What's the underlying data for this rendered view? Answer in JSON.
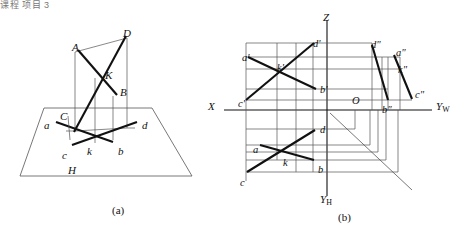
{
  "page": {
    "corner_text": "课程 项目 3",
    "background": "#ffffff",
    "ink": "#111111",
    "thin_line": "#555555"
  },
  "figures": [
    {
      "id": "pictorial",
      "caption": "(a)",
      "plane_label": "H",
      "labels": [
        {
          "text": "A",
          "x": 72,
          "y": 42
        },
        {
          "text": "D",
          "x": 123,
          "y": 28
        },
        {
          "text": "K",
          "x": 105,
          "y": 70
        },
        {
          "text": "B",
          "x": 120,
          "y": 87
        },
        {
          "text": "C",
          "x": 60,
          "y": 111
        },
        {
          "text": "a",
          "x": 44,
          "y": 120
        },
        {
          "text": "d",
          "x": 142,
          "y": 120
        },
        {
          "text": "c",
          "x": 62,
          "y": 150
        },
        {
          "text": "k",
          "x": 87,
          "y": 146
        },
        {
          "text": "b",
          "x": 118,
          "y": 146
        },
        {
          "text": "H",
          "x": 68,
          "y": 165
        }
      ]
    },
    {
      "id": "projection",
      "caption": "(b)",
      "axes": [
        {
          "name": "Z",
          "label": "Z"
        },
        {
          "name": "X",
          "label": "X"
        },
        {
          "name": "YW",
          "label": "Y",
          "sub": "W"
        },
        {
          "name": "YH",
          "label": "Y",
          "sub": "H"
        },
        {
          "name": "O",
          "label": "O"
        }
      ],
      "views": {
        "front": [
          "a'",
          "k'",
          "d'",
          "b'",
          "c'"
        ],
        "top": [
          "a",
          "k",
          "d",
          "b",
          "c"
        ],
        "side": [
          "d\"",
          "a\"",
          "k\"",
          "b\"",
          "c\""
        ]
      },
      "labels": [
        {
          "text": "d'",
          "x": 313,
          "y": 39
        },
        {
          "text": "a'",
          "x": 242,
          "y": 53
        },
        {
          "text": "k'",
          "x": 277,
          "y": 63
        },
        {
          "text": "b'",
          "x": 320,
          "y": 85
        },
        {
          "text": "c'",
          "x": 238,
          "y": 99
        },
        {
          "text": "d\"",
          "x": 371,
          "y": 40
        },
        {
          "text": "a\"",
          "x": 396,
          "y": 48
        },
        {
          "text": "k\"",
          "x": 398,
          "y": 65
        },
        {
          "text": "b\"",
          "x": 382,
          "y": 105
        },
        {
          "text": "c\"",
          "x": 415,
          "y": 90
        },
        {
          "text": "d",
          "x": 320,
          "y": 125
        },
        {
          "text": "a",
          "x": 253,
          "y": 145
        },
        {
          "text": "k",
          "x": 283,
          "y": 158
        },
        {
          "text": "b",
          "x": 318,
          "y": 165
        },
        {
          "text": "c",
          "x": 240,
          "y": 178
        },
        {
          "text": "O",
          "x": 352,
          "y": 96
        }
      ]
    }
  ]
}
